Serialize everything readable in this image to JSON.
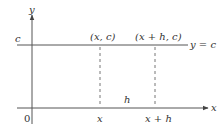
{
  "diagram": {
    "type": "constant-function-graph",
    "colors": {
      "background": "#ffffff",
      "axis": "#555555",
      "line": "#555555",
      "dashed": "#777777",
      "text": "#333333"
    },
    "axes": {
      "x_label": "x",
      "y_label": "y",
      "origin_label": "0"
    },
    "line": {
      "level_label": "c",
      "equation_label": "y = c"
    },
    "points": [
      {
        "label": "(x, c)",
        "x_tick": "x"
      },
      {
        "label": "(x + h, c)",
        "x_tick": "x + h"
      }
    ],
    "interval_label": "h"
  }
}
